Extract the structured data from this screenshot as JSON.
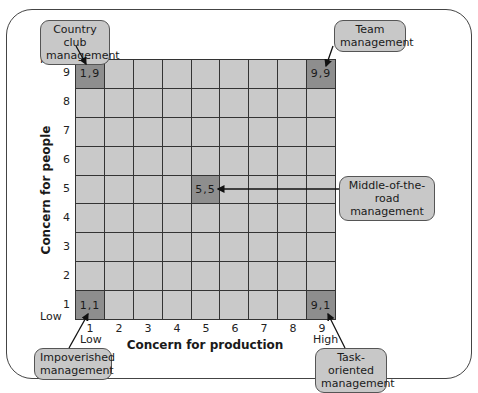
{
  "diagram": {
    "x_axis": {
      "label": "Concern for production",
      "ticks": [
        "1",
        "2",
        "3",
        "4",
        "5",
        "6",
        "7",
        "8",
        "9"
      ],
      "low_label": "Low",
      "high_label": "High"
    },
    "y_axis": {
      "label": "Concern for people",
      "ticks": [
        "9",
        "8",
        "7",
        "6",
        "5",
        "4",
        "3",
        "2",
        "1"
      ],
      "low_label": "Low",
      "high_label": "High"
    },
    "highlighted_cells": [
      {
        "coord": "1,9",
        "x": 1,
        "y": 9,
        "style": "Country club management"
      },
      {
        "coord": "9,9",
        "x": 9,
        "y": 9,
        "style": "Team management"
      },
      {
        "coord": "5,5",
        "x": 5,
        "y": 5,
        "style": "Middle-of-the-road management"
      },
      {
        "coord": "1,1",
        "x": 1,
        "y": 1,
        "style": "Impoverished management"
      },
      {
        "coord": "9,1",
        "x": 9,
        "y": 1,
        "style": "Task-oriented management"
      }
    ],
    "callouts": {
      "country_club": {
        "line1": "Country club",
        "line2": "management"
      },
      "team": {
        "line1": "Team",
        "line2": "management"
      },
      "middle": {
        "line1": "Middle-of-the-road",
        "line2": "management"
      },
      "impoverished": {
        "line1": "Impoverished",
        "line2": "management"
      },
      "task": {
        "line1": "Task-oriented",
        "line2": "management"
      }
    },
    "colors": {
      "cell": "#c9c9c9",
      "highlight_cell": "#8e8e8e",
      "grid_line": "#333333",
      "callout_fill": "#c8c8c8"
    }
  }
}
